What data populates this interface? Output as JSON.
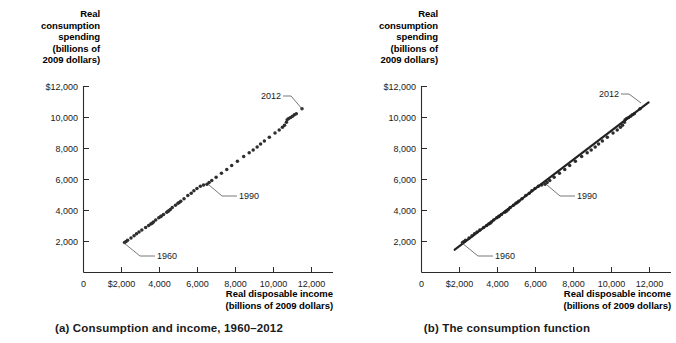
{
  "figure": {
    "background": "#ffffff",
    "ink": "#1a1a1a"
  },
  "panels": [
    {
      "id": "a",
      "caption": "(a) Consumption and income, 1960–2012",
      "y_axis_title": "Real\nconsumption\nspending\n(billions of\n2009 dollars)",
      "x_axis_title": "Real disposable income\n(billions of 2009 dollars)",
      "annotations": [
        {
          "label": "1960"
        },
        {
          "label": "1990"
        },
        {
          "label": "2012"
        }
      ]
    },
    {
      "id": "b",
      "caption": "(b) The consumption function",
      "y_axis_title": "Real\nconsumption\nspending\n(billions of\n2009 dollars)",
      "x_axis_title": "Real disposable income\n(billions of 2009 dollars)",
      "annotations": [
        {
          "label": "1960"
        },
        {
          "label": "1990"
        },
        {
          "label": "2012"
        }
      ]
    }
  ],
  "chart_data": [
    {
      "type": "scatter",
      "title": "(a) Consumption and income, 1960–2012",
      "xlabel": "Real disposable income (billions of 2009 dollars)",
      "ylabel": "Real consumption spending (billions of 2009 dollars)",
      "xlim": [
        0,
        13000
      ],
      "ylim": [
        0,
        13000
      ],
      "xticks": [
        0,
        2000,
        4000,
        6000,
        8000,
        10000,
        12000
      ],
      "xticklabels": [
        "0",
        "$2,000",
        "4,000",
        "6,000",
        "8,000",
        "10,000",
        "12,000"
      ],
      "yticks": [
        2000,
        4000,
        6000,
        8000,
        10000,
        12000
      ],
      "yticklabels": [
        "2,000",
        "4,000",
        "6,000",
        "8,000",
        "10,000",
        "$12,000"
      ],
      "grid": false,
      "legend": null,
      "annotations": [
        {
          "text": "1960",
          "point": [
            2160,
            1930
          ]
        },
        {
          "text": "1990",
          "point": [
            6500,
            5700
          ]
        },
        {
          "text": "2012",
          "point": [
            11500,
            10570
          ]
        }
      ],
      "series": [
        {
          "name": "Real disposable income vs real consumption spending, 1960-2012",
          "x": [
            2160,
            2240,
            2320,
            2500,
            2660,
            2790,
            2920,
            3070,
            3270,
            3430,
            3540,
            3610,
            3680,
            3800,
            3960,
            4050,
            4100,
            4210,
            4380,
            4440,
            4490,
            4570,
            4670,
            4840,
            4970,
            5040,
            5120,
            5290,
            5490,
            5670,
            5810,
            5970,
            6150,
            6320,
            6500,
            6610,
            6750,
            6980,
            7260,
            7540,
            7800,
            8100,
            8430,
            8720,
            8930,
            9140,
            9320,
            9520,
            9780,
            10080,
            10300,
            10470,
            10580,
            10680,
            10720,
            10800,
            10900,
            11000,
            11100,
            11200,
            11500
          ],
          "y": [
            1930,
            2000,
            2080,
            2230,
            2370,
            2500,
            2620,
            2750,
            2900,
            3040,
            3130,
            3180,
            3260,
            3380,
            3530,
            3600,
            3650,
            3740,
            3880,
            3940,
            3980,
            4060,
            4190,
            4340,
            4470,
            4520,
            4600,
            4760,
            4960,
            5110,
            5270,
            5420,
            5560,
            5650,
            5700,
            5800,
            5930,
            6140,
            6400,
            6650,
            6900,
            7180,
            7480,
            7720,
            7900,
            8090,
            8290,
            8490,
            8720,
            9000,
            9200,
            9370,
            9500,
            9700,
            9860,
            9940,
            10000,
            10080,
            10170,
            10250,
            10570
          ],
          "marker": "circle",
          "color": "#2e2e2e"
        }
      ]
    },
    {
      "type": "scatter",
      "title": "(b) The consumption function",
      "xlabel": "Real disposable income (billions of 2009 dollars)",
      "ylabel": "Real consumption spending (billions of 2009 dollars)",
      "xlim": [
        0,
        13000
      ],
      "ylim": [
        0,
        13000
      ],
      "xticks": [
        0,
        2000,
        4000,
        6000,
        8000,
        10000,
        12000
      ],
      "xticklabels": [
        "0",
        "$2,000",
        "4,000",
        "6,000",
        "8,000",
        "10,000",
        "12,000"
      ],
      "yticks": [
        2000,
        4000,
        6000,
        8000,
        10000,
        12000
      ],
      "yticklabels": [
        "2,000",
        "4,000",
        "6,000",
        "8,000",
        "10,000",
        "$12,000"
      ],
      "grid": false,
      "legend": null,
      "annotations": [
        {
          "text": "1960",
          "point": [
            2160,
            1930
          ]
        },
        {
          "text": "1990",
          "point": [
            6500,
            5700
          ]
        },
        {
          "text": "2012",
          "point": [
            11500,
            10570
          ]
        }
      ],
      "series": [
        {
          "name": "Real disposable income vs real consumption spending, 1960-2012",
          "x": [
            2160,
            2240,
            2320,
            2500,
            2660,
            2790,
            2920,
            3070,
            3270,
            3430,
            3540,
            3610,
            3680,
            3800,
            3960,
            4050,
            4100,
            4210,
            4380,
            4440,
            4490,
            4570,
            4670,
            4840,
            4970,
            5040,
            5120,
            5290,
            5490,
            5670,
            5810,
            5970,
            6150,
            6320,
            6500,
            6610,
            6750,
            6980,
            7260,
            7540,
            7800,
            8100,
            8430,
            8720,
            8930,
            9140,
            9320,
            9520,
            9780,
            10080,
            10300,
            10470,
            10580,
            10680,
            10720,
            10800,
            10900,
            11000,
            11100,
            11200,
            11500
          ],
          "y": [
            1930,
            2000,
            2080,
            2230,
            2370,
            2500,
            2620,
            2750,
            2900,
            3040,
            3130,
            3180,
            3260,
            3380,
            3530,
            3600,
            3650,
            3740,
            3880,
            3940,
            3980,
            4060,
            4190,
            4340,
            4470,
            4520,
            4600,
            4760,
            4960,
            5110,
            5270,
            5420,
            5560,
            5650,
            5700,
            5800,
            5930,
            6140,
            6400,
            6650,
            6900,
            7180,
            7480,
            7720,
            7900,
            8090,
            8290,
            8490,
            8720,
            9000,
            9200,
            9370,
            9500,
            9700,
            9860,
            9940,
            10000,
            10080,
            10170,
            10250,
            10570
          ],
          "marker": "circle",
          "color": "#2e2e2e"
        },
        {
          "name": "consumption function (fitted line)",
          "type": "line",
          "x": [
            1750,
            11950
          ],
          "y": [
            1470,
            10970
          ],
          "color": "#222222"
        }
      ]
    }
  ]
}
